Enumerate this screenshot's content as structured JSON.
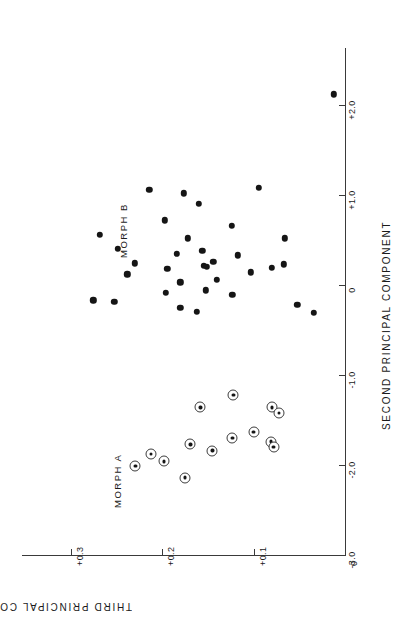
{
  "figure": {
    "orientation": "rotated-90-ccw",
    "background_color": "#ffffff",
    "ink_color": "#1a1a1a"
  },
  "axes": {
    "x": {
      "title": "SECOND PRINCIPAL COMPONENT",
      "ticks": [
        "+2.0",
        "+1.0",
        "0",
        "-1.0",
        "-2.0",
        "-3.0"
      ],
      "tick_values": [
        2.0,
        1.0,
        0.0,
        -1.0,
        -2.0,
        -3.0
      ],
      "range": [
        -3.0,
        2.45
      ]
    },
    "y": {
      "title": "THIRD PRINCIPAL COMPONENT",
      "ticks": [
        "+0.3",
        "+0.2",
        "+0.1",
        "0"
      ],
      "tick_values": [
        0.3,
        0.2,
        0.1,
        0.0
      ],
      "range": [
        0.0,
        0.345
      ]
    }
  },
  "groups": [
    {
      "name": "morph-a",
      "label": "MORPH A",
      "marker": "circle-with-center-dot"
    },
    {
      "name": "morph-b",
      "label": "MORPH B",
      "marker": "filled-circle"
    }
  ],
  "chart_data": {
    "type": "scatter",
    "title": "",
    "xlabel": "SECOND PRINCIPAL COMPONENT",
    "ylabel": "THIRD PRINCIPAL COMPONENT",
    "xlim": [
      -3.0,
      2.45
    ],
    "ylim": [
      0.0,
      0.345
    ],
    "xticks": [
      -3.0,
      -2.0,
      -1.0,
      0.0,
      1.0,
      2.0
    ],
    "xticklabels": [
      "-3.0",
      "-2.0",
      "-1.0",
      "0",
      "+1.0",
      "+2.0"
    ],
    "yticks": [
      0.0,
      0.1,
      0.2,
      0.3
    ],
    "yticklabels": [
      "0",
      "+0.1",
      "+0.2",
      "+0.3"
    ],
    "grid": false,
    "legend": "in-plot annotations",
    "annotations": [
      {
        "text": "MORPH A",
        "x": -1.95,
        "y": 0.233
      },
      {
        "text": "MORPH B",
        "x": 0.3,
        "y": 0.225
      }
    ],
    "series": [
      {
        "name": "MORPH B",
        "marker": "filled-circle",
        "color": "#151515",
        "points": [
          [
            2.12,
            0.012
          ],
          [
            1.06,
            0.214
          ],
          [
            1.02,
            0.176
          ],
          [
            1.08,
            0.094
          ],
          [
            0.9,
            0.16
          ],
          [
            0.72,
            0.197
          ],
          [
            0.66,
            0.124
          ],
          [
            0.56,
            0.268
          ],
          [
            0.52,
            0.172
          ],
          [
            0.52,
            0.066
          ],
          [
            0.4,
            0.248
          ],
          [
            0.38,
            0.156
          ],
          [
            0.35,
            0.184
          ],
          [
            0.33,
            0.117
          ],
          [
            0.26,
            0.144
          ],
          [
            0.24,
            0.23
          ],
          [
            0.23,
            0.067
          ],
          [
            0.21,
            0.154
          ],
          [
            0.2,
            0.151
          ],
          [
            0.19,
            0.08
          ],
          [
            0.18,
            0.194
          ],
          [
            0.14,
            0.103
          ],
          [
            0.12,
            0.238
          ],
          [
            0.06,
            0.14
          ],
          [
            0.03,
            0.18
          ],
          [
            -0.06,
            0.152
          ],
          [
            -0.09,
            0.196
          ],
          [
            -0.11,
            0.123
          ],
          [
            -0.17,
            0.275
          ],
          [
            -0.19,
            0.252
          ],
          [
            -0.22,
            0.052
          ],
          [
            -0.25,
            0.18
          ],
          [
            -0.3,
            0.162
          ],
          [
            -0.31,
            0.034
          ]
        ]
      },
      {
        "name": "MORPH A",
        "marker": "circle-with-center-dot",
        "color": "#3c3c3c",
        "points": [
          [
            -1.22,
            0.122
          ],
          [
            -1.36,
            0.158
          ],
          [
            -1.36,
            0.08
          ],
          [
            -1.42,
            0.072
          ],
          [
            -1.63,
            0.1
          ],
          [
            -1.7,
            0.123
          ],
          [
            -1.74,
            0.081
          ],
          [
            -1.77,
            0.169
          ],
          [
            -1.8,
            0.078
          ],
          [
            -1.84,
            0.145
          ],
          [
            -1.88,
            0.212
          ],
          [
            -1.96,
            0.198
          ],
          [
            -2.01,
            0.229
          ],
          [
            -2.14,
            0.175
          ]
        ]
      }
    ]
  }
}
